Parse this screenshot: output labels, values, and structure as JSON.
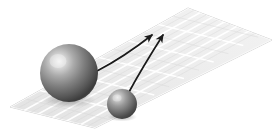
{
  "figure": {
    "name": "two-spheres-on-grid-plane",
    "caption": "",
    "background_color": "#ffffff",
    "width": 279,
    "height": 136
  },
  "plane": {
    "name": "grid-plane",
    "shape": "parallelogram",
    "fill_color": "#e8e8e8",
    "grid_line_color": "#ffffff",
    "edge_color": "#c9c9c9",
    "corners": {
      "left": [
        10,
        107
      ],
      "top": [
        188,
        8
      ],
      "right": [
        272,
        40
      ],
      "bottom": [
        95,
        128
      ]
    },
    "grid_divisions_u": 6,
    "grid_divisions_v": 6
  },
  "objects": [
    {
      "name": "large-sphere",
      "label": "",
      "center": [
        69,
        73
      ],
      "radius": 29,
      "fill_color": "#6e6e6e",
      "highlight_color": "#e6e6e6",
      "shadow_color": "#2a2a2a"
    },
    {
      "name": "small-sphere",
      "label": "",
      "center": [
        122,
        104
      ],
      "radius": 15,
      "fill_color": "#6a6a6a",
      "highlight_color": "#d8d8d8",
      "shadow_color": "#262626"
    }
  ],
  "arrows": [
    {
      "name": "arrow-from-large-sphere",
      "label": "",
      "start": [
        97,
        71
      ],
      "control": [
        124,
        57
      ],
      "end": [
        153,
        34
      ],
      "color": "#1a1a1a",
      "stroke_width": 1.6
    },
    {
      "name": "arrow-from-small-sphere",
      "label": "",
      "start": [
        129,
        91
      ],
      "control": [
        143,
        66
      ],
      "end": [
        164,
        34
      ],
      "color": "#1a1a1a",
      "stroke_width": 1.6
    }
  ],
  "shadows": [
    {
      "name": "large-sphere-contact-shadow",
      "center": [
        69,
        101
      ],
      "rx": 26,
      "ry": 7,
      "color": "rgba(60,60,60,0.30)"
    },
    {
      "name": "small-sphere-contact-shadow",
      "center": [
        122,
        118
      ],
      "rx": 14,
      "ry": 4,
      "color": "rgba(60,60,60,0.28)"
    }
  ]
}
